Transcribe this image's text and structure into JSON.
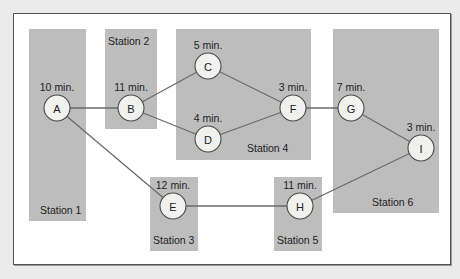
{
  "diagram": {
    "type": "assembly-line-balancing-precedence-diagram",
    "stations": [
      {
        "id": "station-1",
        "label": "Station 1",
        "x": 29,
        "y": 29,
        "w": 57,
        "h": 192,
        "label_x": 40,
        "label_y": 214
      },
      {
        "id": "station-2",
        "label": "Station 2",
        "x": 105,
        "y": 29,
        "w": 52,
        "h": 100,
        "label_x": 108,
        "label_y": 45
      },
      {
        "id": "station-3",
        "label": "Station 3",
        "x": 150,
        "y": 177,
        "w": 48,
        "h": 74,
        "label_x": 153,
        "label_y": 244
      },
      {
        "id": "station-4",
        "label": "Station 4",
        "x": 176,
        "y": 29,
        "w": 135,
        "h": 131,
        "label_x": 247,
        "label_y": 152
      },
      {
        "id": "station-5",
        "label": "Station 5",
        "x": 274,
        "y": 177,
        "w": 48,
        "h": 74,
        "label_x": 277,
        "label_y": 244
      },
      {
        "id": "station-6",
        "label": "Station 6",
        "x": 333,
        "y": 29,
        "w": 106,
        "h": 184,
        "label_x": 372,
        "label_y": 206
      }
    ],
    "tasks": [
      {
        "id": "A",
        "label": "A",
        "time": "10 min.",
        "cx": 57,
        "cy": 108,
        "tx": 57,
        "ty": 91
      },
      {
        "id": "B",
        "label": "B",
        "time": "11 min.",
        "cx": 131,
        "cy": 108,
        "tx": 131,
        "ty": 91
      },
      {
        "id": "C",
        "label": "C",
        "time": "5 min.",
        "cx": 208,
        "cy": 66,
        "tx": 208,
        "ty": 49
      },
      {
        "id": "D",
        "label": "D",
        "time": "4 min.",
        "cx": 208,
        "cy": 139,
        "tx": 208,
        "ty": 122
      },
      {
        "id": "E",
        "label": "E",
        "time": "12 min.",
        "cx": 173,
        "cy": 206,
        "tx": 173,
        "ty": 189
      },
      {
        "id": "F",
        "label": "F",
        "time": "3 min.",
        "cx": 293,
        "cy": 108,
        "tx": 293,
        "ty": 91
      },
      {
        "id": "G",
        "label": "G",
        "time": "7 min.",
        "cx": 351,
        "cy": 108,
        "tx": 351,
        "ty": 91
      },
      {
        "id": "H",
        "label": "H",
        "time": "11 min.",
        "cx": 300,
        "cy": 206,
        "tx": 300,
        "ty": 189
      },
      {
        "id": "I",
        "label": "I",
        "time": "3 min.",
        "cx": 421,
        "cy": 148,
        "tx": 421,
        "ty": 131
      }
    ],
    "edges": [
      {
        "from": "A",
        "to": "B"
      },
      {
        "from": "A",
        "to": "E"
      },
      {
        "from": "B",
        "to": "C"
      },
      {
        "from": "B",
        "to": "D"
      },
      {
        "from": "C",
        "to": "F"
      },
      {
        "from": "D",
        "to": "F"
      },
      {
        "from": "F",
        "to": "G"
      },
      {
        "from": "G",
        "to": "I"
      },
      {
        "from": "E",
        "to": "H"
      },
      {
        "from": "H",
        "to": "I"
      }
    ],
    "node_radius": 13,
    "colors": {
      "background": "#ebebeb",
      "frame": "#ffffff",
      "station_fill": "#bdbdbd",
      "edge": "#6a6a6a",
      "node_fill": "#f1f1ef",
      "node_stroke": "#4a4a4a",
      "text": "#222222"
    }
  }
}
